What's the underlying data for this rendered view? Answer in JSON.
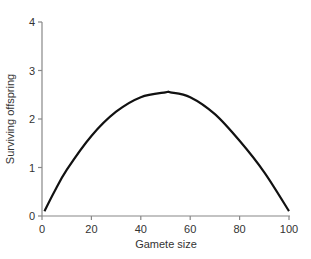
{
  "chart_data": {
    "type": "line",
    "title": "",
    "xlabel": "Gamete size",
    "ylabel": "Surviving offspring",
    "xlim": [
      0,
      100
    ],
    "ylim": [
      0,
      4
    ],
    "xticks": [
      0,
      20,
      40,
      60,
      80,
      100
    ],
    "yticks": [
      0,
      1,
      2,
      3,
      4
    ],
    "grid": false,
    "legend": null,
    "series": [
      {
        "name": "Surviving offspring",
        "x": [
          1,
          5,
          10,
          20,
          30,
          40,
          50,
          52,
          60,
          70,
          80,
          90,
          100
        ],
        "y": [
          0.1,
          0.5,
          0.95,
          1.65,
          2.15,
          2.45,
          2.55,
          2.55,
          2.45,
          2.1,
          1.55,
          0.9,
          0.1
        ]
      }
    ]
  }
}
